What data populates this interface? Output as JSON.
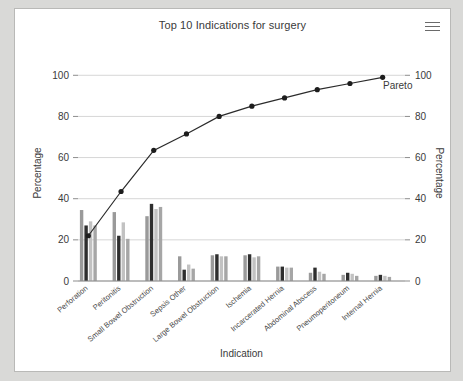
{
  "card": {
    "title": "Top 10 Indications for surgery",
    "menu_icon": "hamburger-menu-icon"
  },
  "chart_data": {
    "type": "bar",
    "title": "Top 10 Indications for surgery",
    "xlabel": "Indication",
    "ylabel": "Percentage",
    "ylabel_right": "Percentage",
    "ylim": [
      0,
      105
    ],
    "yticks": [
      0,
      20,
      40,
      60,
      80,
      100
    ],
    "yticks_right": [
      0,
      20,
      40,
      60,
      80,
      100
    ],
    "grid": true,
    "legend": false,
    "categories": [
      "Perforation",
      "Peritonitis",
      "Small Bowel Obstruction",
      "Sepsis Other",
      "Large Bowel Obstruction",
      "Ischemia",
      "Incarcerated Hernia",
      "Abdominal Abscess",
      "Pneumoperitoneum",
      "Internal Hernia"
    ],
    "series": [
      {
        "name": "bar-1",
        "color": "#9a9a9a",
        "values": [
          34.5,
          33.5,
          31.5,
          12.0,
          12.5,
          12.5,
          7.0,
          4.0,
          3.0,
          2.5
        ]
      },
      {
        "name": "bar-2",
        "color": "#2e2e2e",
        "values": [
          27.0,
          22.0,
          37.5,
          5.5,
          13.0,
          13.0,
          7.0,
          6.5,
          4.0,
          3.0
        ]
      },
      {
        "name": "bar-3",
        "color": "#c2c2c2",
        "values": [
          29.0,
          28.5,
          35.0,
          8.0,
          12.0,
          11.5,
          6.5,
          4.5,
          3.5,
          2.5
        ]
      },
      {
        "name": "bar-4",
        "color": "#a6a6a6",
        "values": [
          27.0,
          20.5,
          36.0,
          6.0,
          12.0,
          12.0,
          6.5,
          3.5,
          2.5,
          2.0
        ]
      }
    ],
    "pareto": {
      "name": "Pareto",
      "label": "Pareto",
      "color": "#1d1d1d",
      "values": [
        22,
        43.5,
        63.5,
        71.5,
        80,
        85,
        89,
        93,
        96,
        99
      ]
    }
  }
}
